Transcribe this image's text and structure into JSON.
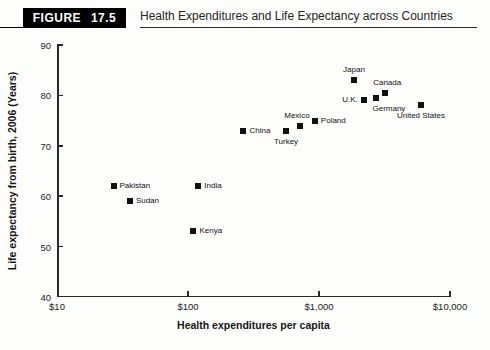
{
  "header": {
    "figure_label": "FIGURE 17.5",
    "title": "Health Expenditures and Life Expectancy across Countries"
  },
  "chart_data": {
    "type": "scatter",
    "title": "Health Expenditures and Life Expectancy across Countries",
    "xlabel": "Health expenditures per capita",
    "ylabel": "Life expectancy from birth, 2006 (Years)",
    "x_scale": "log",
    "xlim": [
      10,
      10000
    ],
    "ylim": [
      40,
      90
    ],
    "grid": false,
    "legend": "none",
    "x_ticks": [
      {
        "value": 10,
        "label": "$10"
      },
      {
        "value": 100,
        "label": "$100"
      },
      {
        "value": 1000,
        "label": "$1,000"
      },
      {
        "value": 10000,
        "label": "$10,000"
      }
    ],
    "y_ticks": [
      {
        "value": 90,
        "label": "90"
      },
      {
        "value": 80,
        "label": "80"
      },
      {
        "value": 70,
        "label": "70"
      },
      {
        "value": 60,
        "label": "60"
      },
      {
        "value": 50,
        "label": "50"
      },
      {
        "value": 40,
        "label": "40"
      }
    ],
    "points": [
      {
        "label": "Pakistan",
        "x": 27,
        "y": 62,
        "label_pos": "right"
      },
      {
        "label": "Sudan",
        "x": 36,
        "y": 59,
        "label_pos": "right"
      },
      {
        "label": "India",
        "x": 120,
        "y": 62,
        "label_pos": "right"
      },
      {
        "label": "Kenya",
        "x": 110,
        "y": 53,
        "label_pos": "right"
      },
      {
        "label": "China",
        "x": 265,
        "y": 73,
        "label_pos": "right"
      },
      {
        "label": "Turkey",
        "x": 560,
        "y": 73,
        "label_pos": "below"
      },
      {
        "label": "Mexico",
        "x": 715,
        "y": 74,
        "label_pos": "above",
        "dx": -3
      },
      {
        "label": "Poland",
        "x": 930,
        "y": 75,
        "label_pos": "right"
      },
      {
        "label": "U.K.",
        "x": 2200,
        "y": 79,
        "label_pos": "left"
      },
      {
        "label": "Germany",
        "x": 2720,
        "y": 79.5,
        "label_pos": "below",
        "dx": 13
      },
      {
        "label": "Japan",
        "x": 1850,
        "y": 83,
        "label_pos": "above"
      },
      {
        "label": "Canada",
        "x": 3200,
        "y": 80.5,
        "label_pos": "above",
        "dx": 2
      },
      {
        "label": "United States",
        "x": 6000,
        "y": 78,
        "label_pos": "below"
      }
    ]
  },
  "colors": {
    "marker": "#111111",
    "axis": "#2a2a2a",
    "badge_bg": "#000000",
    "badge_text": "#ffffff",
    "text": "#1c1c1c"
  }
}
